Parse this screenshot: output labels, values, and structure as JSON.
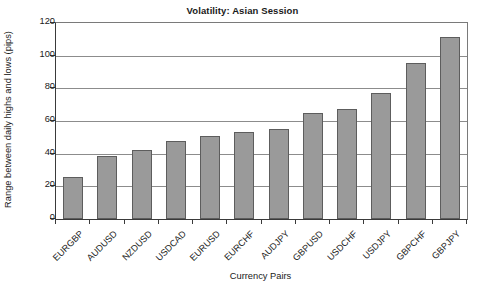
{
  "chart_data": {
    "type": "bar",
    "title": "Volatility: Asian Session",
    "xlabel": "Currency Pairs",
    "ylabel": "Range between daily highs and lows (pips)",
    "categories": [
      "EURGBP",
      "AUDUSD",
      "NZDUSD",
      "USDCAD",
      "EURUSD",
      "EURCHF",
      "AUDJPY",
      "GBPUSD",
      "USDCHF",
      "USDJPY",
      "GBPCHF",
      "GBPJPY"
    ],
    "values": [
      25.5,
      38.5,
      42.5,
      47.5,
      51,
      53,
      55,
      65,
      67.5,
      77,
      95.5,
      111.5
    ],
    "ylim": [
      0,
      120
    ],
    "yticks": [
      0,
      20,
      40,
      60,
      80,
      100,
      120
    ],
    "ytick_labels": [
      "0",
      "20",
      "40",
      "60",
      "80",
      "100",
      "120"
    ],
    "grid": true,
    "legend": false,
    "bar_color": "#9a9a9a",
    "bar_border_color": "#5d5d5d",
    "grid_color": "#8c8c8c",
    "axis_color": "#3a3a3a",
    "background": "#ffffff"
  }
}
